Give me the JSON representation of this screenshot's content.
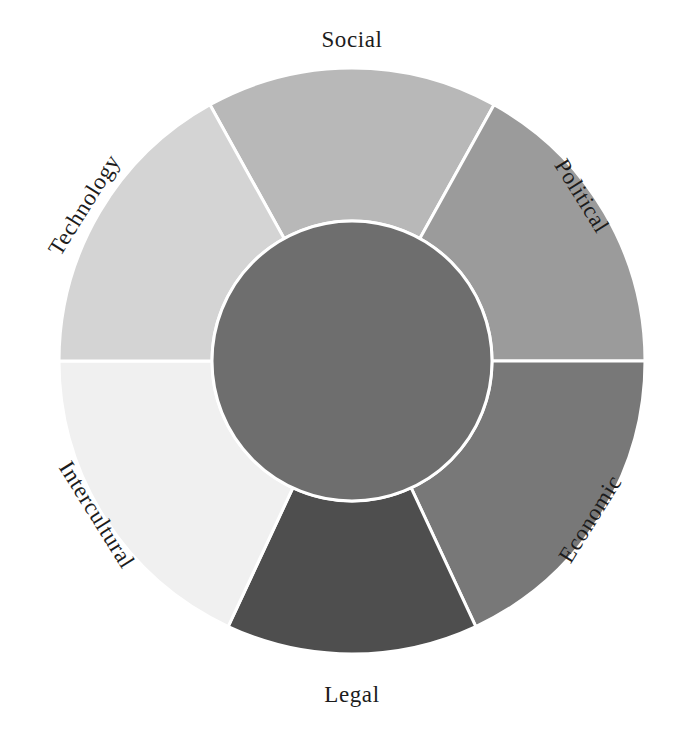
{
  "diagram": {
    "type": "donut-wheel",
    "title": "",
    "background_color": "#ffffff",
    "divider_color": "#ffffff",
    "label_color": "#1c1c1c",
    "center": {
      "x": 352,
      "y": 361
    },
    "outer_radius": 293,
    "inner_radius": 140,
    "hub": {
      "name": "hub",
      "label": "",
      "color": "#6e6e6e"
    },
    "segments": [
      {
        "id": "social",
        "label": "Social",
        "color": "#b8b8b8",
        "start_angle": 61,
        "end_angle": 119,
        "label_x": 352,
        "label_y": 42,
        "label_rotation": 0
      },
      {
        "id": "political",
        "label": "Political",
        "color": "#9b9b9b",
        "start_angle": 0,
        "end_angle": 61,
        "label_x": 580,
        "label_y": 197,
        "label_rotation": 58
      },
      {
        "id": "economic",
        "label": "Economic",
        "color": "#787878",
        "start_angle": -65,
        "end_angle": 0,
        "label_x": 592,
        "label_y": 520,
        "label_rotation": -58
      },
      {
        "id": "legal",
        "label": "Legal",
        "color": "#4e4e4e",
        "start_angle": -115,
        "end_angle": -65,
        "label_x": 352,
        "label_y": 697,
        "label_rotation": 0
      },
      {
        "id": "intercultural",
        "label": "Intercultural",
        "color": "#f0f0f0",
        "start_angle": 180,
        "end_angle": 245,
        "label_x": 95,
        "label_y": 516,
        "label_rotation": 58
      },
      {
        "id": "technology",
        "label": "Technology",
        "color": "#d4d4d4",
        "start_angle": 119,
        "end_angle": 180,
        "label_x": 86,
        "label_y": 206,
        "label_rotation": -58
      }
    ]
  }
}
